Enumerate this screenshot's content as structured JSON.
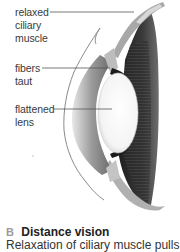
{
  "diagram": {
    "labels": [
      {
        "id": "relaxed-ciliary-muscle",
        "lines": [
          "relaxed",
          "ciliary",
          "muscle"
        ]
      },
      {
        "id": "fibers-taut",
        "lines": [
          "fibers",
          "taut"
        ]
      },
      {
        "id": "flattened-lens",
        "lines": [
          "flattened",
          "lens"
        ]
      }
    ],
    "colors": {
      "label_text": "#3a3a3a",
      "leader_line": "#555555",
      "caption_letter": "#9a9a9a",
      "caption_title": "#222222",
      "retina_dark": "#2a2a2a",
      "lens": "#ffffff",
      "cornea": "#bdbdbd"
    }
  },
  "caption": {
    "letter": "B",
    "title": "Distance vision",
    "body": "Relaxation of ciliary muscle pulls"
  }
}
